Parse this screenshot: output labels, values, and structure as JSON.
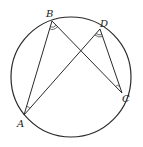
{
  "diagram": {
    "type": "circle-inscribed-angles",
    "circle": {
      "cx": 71,
      "cy": 77,
      "r": 60
    },
    "points": [
      {
        "name": "A",
        "x": 24,
        "y": 115,
        "label_x": 17,
        "label_y": 127
      },
      {
        "name": "B",
        "x": 52,
        "y": 21,
        "label_x": 46,
        "label_y": 17
      },
      {
        "name": "C",
        "x": 122,
        "y": 93,
        "label_x": 122,
        "label_y": 102
      },
      {
        "name": "D",
        "x": 100,
        "y": 29,
        "label_x": 100,
        "label_y": 27
      }
    ],
    "segments": [
      [
        "A",
        "B"
      ],
      [
        "A",
        "D"
      ],
      [
        "B",
        "C"
      ],
      [
        "D",
        "C"
      ]
    ],
    "angle_marks": [
      {
        "vertex": "B",
        "between": [
          "A",
          "C"
        ],
        "arcs": 2
      },
      {
        "vertex": "D",
        "between": [
          "A",
          "C"
        ],
        "arcs": 2
      },
      {
        "vertex": "A",
        "between": [
          "B",
          "D"
        ],
        "arcs": 1
      },
      {
        "vertex": "C",
        "between": [
          "B",
          "D"
        ],
        "arcs": 1
      }
    ],
    "stroke_color": "#2a2a2a"
  }
}
